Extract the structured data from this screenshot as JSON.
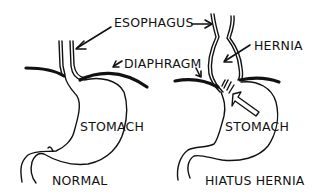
{
  "figure": {
    "panels": [
      {
        "id": "normal",
        "caption": "NORMAL",
        "labels": {
          "esophagus": "ESOPHAGUS",
          "diaphragm": "DIAPHRAGM",
          "stomach": "STOMACH"
        }
      },
      {
        "id": "hiatus-hernia",
        "caption": "HIATUS HERNIA",
        "labels": {
          "hernia": "HERNIA",
          "stomach": "STOMACH"
        }
      }
    ],
    "colors": {
      "ink": "#111111",
      "background": "#ffffff"
    }
  }
}
